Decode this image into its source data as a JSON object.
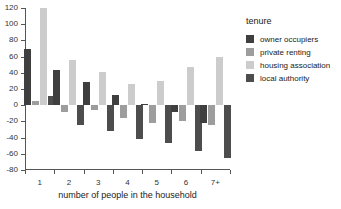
{
  "chart_data": {
    "type": "bar",
    "title": "",
    "subtitle": "",
    "xlabel": "number of people in the household",
    "ylabel": "",
    "categories": [
      "1",
      "2",
      "3",
      "4",
      "5",
      "6",
      "7+"
    ],
    "series": [
      {
        "name": "owner occupiers",
        "color": "#3f3f3f",
        "values": [
          69,
          44,
          29,
          12,
          1,
          -8,
          -22
        ]
      },
      {
        "name": "private renting",
        "color": "#9d9d9d",
        "values": [
          5,
          -9,
          -6,
          -16,
          -22,
          -20,
          -25
        ]
      },
      {
        "name": "housing association",
        "color": "#cccccc",
        "values": [
          120,
          56,
          41,
          26,
          30,
          47,
          60
        ]
      },
      {
        "name": "local authority",
        "color": "#4d4d4d",
        "values": [
          11,
          -24,
          -32,
          -42,
          -47,
          -56,
          -65
        ]
      }
    ],
    "ylim": [
      -80,
      120
    ],
    "yticks": [
      120,
      100,
      80,
      60,
      40,
      20,
      0,
      -20,
      -40,
      -60,
      -80
    ],
    "grid": false,
    "legend_position": "right",
    "legend_title": "tenure",
    "axis_color": "#555555"
  }
}
